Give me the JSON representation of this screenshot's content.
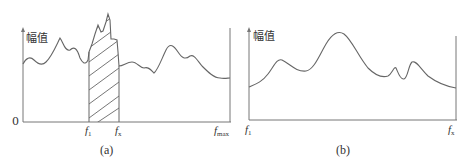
{
  "figure": {
    "panels": [
      {
        "id": "a",
        "caption": "(a)",
        "y_axis_label": "幅值",
        "origin_label": "0",
        "x_ticks": [
          {
            "main": "f",
            "sub": "1"
          },
          {
            "main": "f",
            "sub": "x"
          },
          {
            "main": "f",
            "sub": "max"
          }
        ],
        "shaded_band": {
          "from": "f1",
          "to": "fx",
          "pattern": "diagonal-hatch"
        }
      },
      {
        "id": "b",
        "caption": "(b)",
        "y_axis_label": "幅值",
        "x_ticks": [
          {
            "main": "f",
            "sub": "1"
          },
          {
            "main": "f",
            "sub": "x"
          }
        ]
      }
    ],
    "colors": {
      "line": "#666666",
      "axis": "#777777",
      "text": "#333333"
    }
  }
}
